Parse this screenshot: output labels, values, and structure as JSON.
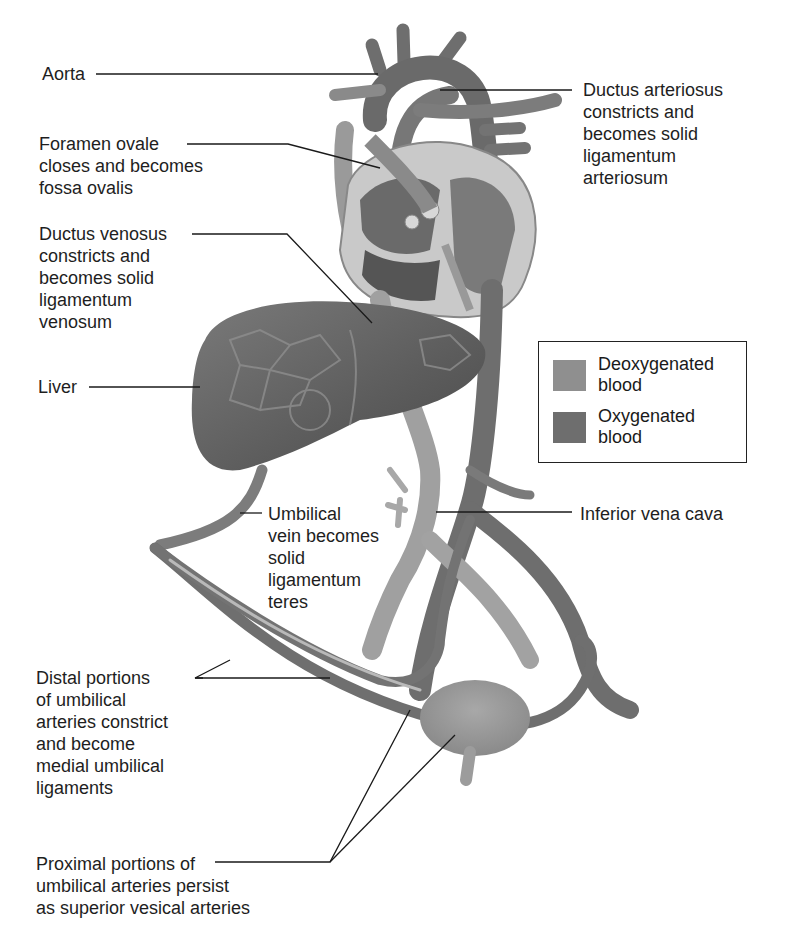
{
  "figure": {
    "labels": {
      "aorta": "Aorta",
      "foramen_ovale": "Foramen ovale\ncloses and becomes\nfossa ovalis",
      "ductus_venosus": "Ductus venosus\nconstricts and\nbecomes solid\nligamentum\nvenosum",
      "liver": "Liver",
      "ductus_arteriosus": "Ductus arteriosus\nconstricts and\nbecomes solid\nligamentum\narteriosum",
      "umbilical_vein": "Umbilical\nvein becomes\nsolid\nligamentum\nteres",
      "inferior_vena_cava": "Inferior vena cava",
      "distal_umbilical_arteries": "Distal portions\nof umbilical\narteries constrict\nand become\nmedial umbilical\nligaments",
      "proximal_umbilical_arteries": "Proximal portions of\numbilical arteries persist\nas superior vesical arteries"
    },
    "legend": {
      "items": [
        {
          "label": "Deoxygenated\nblood",
          "color": "#8f8f8f"
        },
        {
          "label": "Oxygenated\nblood",
          "color": "#6e6e6e"
        }
      ]
    },
    "colors": {
      "vessel_dark": "#6a6a6a",
      "vessel_light": "#9a9a9a",
      "liver": "#5e5e5e",
      "heart_wall": "#bdbdbd",
      "leader_line": "#1a1a1a"
    }
  }
}
